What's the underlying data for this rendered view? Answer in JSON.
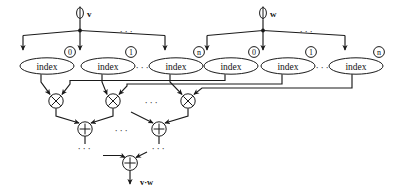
{
  "diagram": {
    "inputs": [
      {
        "id": "v",
        "label": "v",
        "icon": "input-port-icon",
        "x": 110,
        "y": 14
      },
      {
        "id": "w",
        "label": "w",
        "icon": "input-port-icon",
        "x": 290,
        "y": 14
      }
    ],
    "index_nodes": [
      {
        "id": "v0",
        "label": "index",
        "subscript": "0",
        "vector": "v",
        "cx": 47,
        "cy": 66
      },
      {
        "id": "v1",
        "label": "index",
        "subscript": "1",
        "vector": "v",
        "cx": 108,
        "cy": 66
      },
      {
        "id": "vn",
        "label": "index",
        "subscript": "n",
        "vector": "v",
        "cx": 176,
        "cy": 66
      },
      {
        "id": "w0",
        "label": "index",
        "subscript": "0",
        "vector": "w",
        "cx": 231,
        "cy": 66
      },
      {
        "id": "w1",
        "label": "index",
        "subscript": "1",
        "vector": "w",
        "cx": 288,
        "cy": 66
      },
      {
        "id": "wn",
        "label": "index",
        "subscript": "n",
        "vector": "w",
        "cx": 356,
        "cy": 66
      }
    ],
    "multiply_nodes": [
      {
        "id": "m0",
        "label": "×",
        "icon": "multiply-icon",
        "cx": 56,
        "cy": 101
      },
      {
        "id": "m1",
        "label": "×",
        "icon": "multiply-icon",
        "cx": 113,
        "cy": 101
      },
      {
        "id": "mn",
        "label": "×",
        "icon": "multiply-icon",
        "cx": 188,
        "cy": 101
      }
    ],
    "add_nodes": [
      {
        "id": "a0",
        "label": "+",
        "icon": "plus-icon",
        "cx": 85,
        "cy": 129
      },
      {
        "id": "a1",
        "label": "+",
        "icon": "plus-icon",
        "cx": 159,
        "cy": 129
      },
      {
        "id": "af",
        "label": "+",
        "icon": "plus-icon",
        "cx": 130,
        "cy": 163
      }
    ],
    "ellipses": [
      {
        "id": "e-v-top",
        "text": "···",
        "x": 127,
        "y": 31
      },
      {
        "id": "e-w-top",
        "text": "···",
        "x": 307,
        "y": 31
      },
      {
        "id": "e-v-idx",
        "text": "···",
        "x": 143,
        "y": 67
      },
      {
        "id": "e-w-idx",
        "text": "···",
        "x": 323,
        "y": 67
      },
      {
        "id": "e-mul",
        "text": "···",
        "x": 152,
        "y": 102
      },
      {
        "id": "e-add",
        "text": "···",
        "x": 122,
        "y": 130
      },
      {
        "id": "e-a0-dn",
        "text": "···",
        "x": 85,
        "y": 148
      },
      {
        "id": "e-a1-dn",
        "text": "···",
        "x": 159,
        "y": 148
      }
    ],
    "output": {
      "id": "result",
      "label": "v·w",
      "x": 141,
      "y": 182
    }
  },
  "colors": {
    "stroke": "#1a1a1a",
    "fill": "#ffffff",
    "text": "#111111",
    "background": "#ffffff"
  }
}
